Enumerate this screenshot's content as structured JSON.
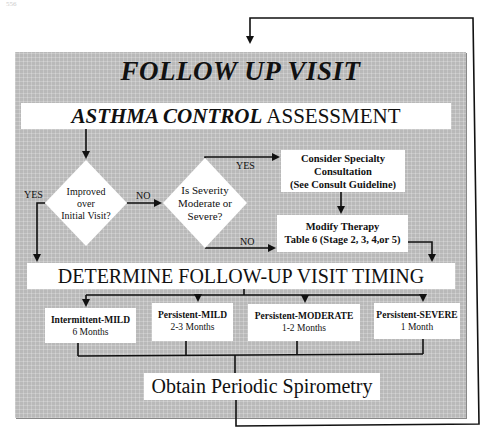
{
  "page_number": "556",
  "title": "FOLLOW UP VISIT",
  "assessment": {
    "emphasis": "ASTHMA CONTROL",
    "rest": " ASSESSMENT"
  },
  "decisions": [
    {
      "id": "improved",
      "lines": [
        "Improved",
        "over",
        "Initial Visit?"
      ],
      "yes_label": "YES",
      "no_label": "NO"
    },
    {
      "id": "severity",
      "lines": [
        "Is Severity",
        "Moderate or",
        "Severe?"
      ],
      "yes_label": "YES",
      "no_label": "NO"
    }
  ],
  "consult": {
    "lines": [
      "Consider Specialty",
      "Consultation",
      "(See Consult Guideline)"
    ]
  },
  "modify": {
    "lines": [
      "Modify Therapy",
      "Table 6 (Stage 2, 3, 4,or 5)"
    ]
  },
  "determine": "DETERMINE FOLLOW-UP VISIT TIMING",
  "severity_levels": [
    {
      "name": "Intermittent-MILD",
      "timing": "6 Months"
    },
    {
      "name": "Persistent-MILD",
      "timing": "2-3 Months"
    },
    {
      "name": "Persistent-MODERATE",
      "timing": "1-2 Months"
    },
    {
      "name": "Persistent-SEVERE",
      "timing": "1 Month"
    }
  ],
  "spirometry": "Obtain Periodic Spirometry",
  "colors": {
    "panel": "#b9b9b9",
    "box": "#ffffff",
    "line": "#111111"
  }
}
